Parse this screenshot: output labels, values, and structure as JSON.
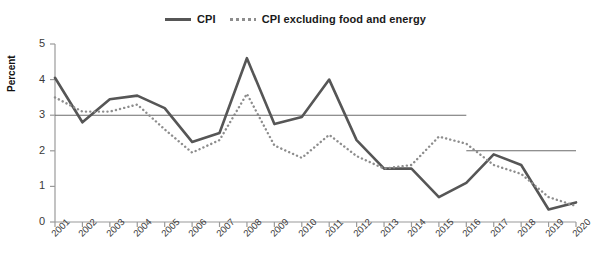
{
  "legend": {
    "items": [
      {
        "label": "CPI",
        "style": "solid",
        "color": "#565656",
        "icon": "line-solid-icon"
      },
      {
        "label": "CPI excluding food and energy",
        "style": "dotted",
        "color": "#8d8d8d",
        "icon": "line-dotted-icon"
      }
    ]
  },
  "axes": {
    "ylabel": "Percent",
    "yticks": [
      "0",
      "1",
      "2",
      "3",
      "4",
      "5"
    ],
    "xticks": [
      "2001",
      "2002",
      "2003",
      "2004",
      "2005",
      "2006",
      "2007",
      "2008",
      "2009",
      "2010",
      "2011",
      "2012",
      "2013",
      "2014",
      "2015",
      "2016",
      "2017",
      "2018",
      "2019",
      "2020"
    ]
  },
  "chart_data": {
    "type": "line",
    "title": "",
    "xlabel": "",
    "ylabel": "Percent",
    "ylim": [
      0,
      5
    ],
    "grid": false,
    "legend_position": "top-center",
    "x": [
      "2001",
      "2002",
      "2003",
      "2004",
      "2005",
      "2006",
      "2007",
      "2008",
      "2009",
      "2010",
      "2011",
      "2012",
      "2013",
      "2014",
      "2015",
      "2016",
      "2017",
      "2018",
      "2019",
      "2020"
    ],
    "series": [
      {
        "name": "CPI",
        "style": "solid",
        "color": "#565656",
        "values": [
          4.05,
          2.8,
          3.45,
          3.55,
          3.2,
          2.25,
          2.5,
          4.6,
          2.75,
          2.95,
          4.0,
          2.3,
          1.5,
          1.5,
          0.7,
          1.1,
          1.9,
          1.6,
          0.35,
          0.55
        ]
      },
      {
        "name": "CPI excluding food and energy",
        "style": "dotted",
        "color": "#8d8d8d",
        "values": [
          3.5,
          3.1,
          3.1,
          3.3,
          2.6,
          1.95,
          2.3,
          3.6,
          2.15,
          1.8,
          2.45,
          1.85,
          1.5,
          1.6,
          2.4,
          2.2,
          1.6,
          1.35,
          0.7,
          0.45
        ]
      }
    ],
    "reference_lines": [
      {
        "name": "target-3-percent",
        "value": 3.0,
        "x_start": "2001",
        "x_end": "2016",
        "color": "#6b6b6b"
      },
      {
        "name": "target-2-percent",
        "value": 2.0,
        "x_start": "2016",
        "x_end": "2020",
        "color": "#6b6b6b"
      }
    ]
  }
}
